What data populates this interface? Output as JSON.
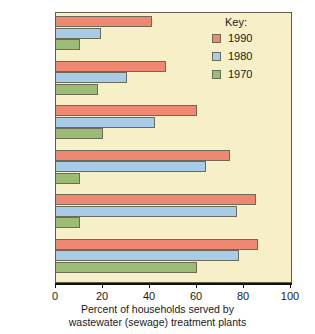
{
  "chart_data": {
    "type": "bar",
    "orientation": "horizontal",
    "title": "",
    "xlabel": "Percent of households served by wastewater (sewage) treatment plants",
    "ylabel": "",
    "xlim": [
      0,
      100
    ],
    "xticks": [
      0,
      20,
      40,
      60,
      80,
      100
    ],
    "grid": false,
    "legend_position": "top-right",
    "legend_title": "Key:",
    "categories": [
      "Spain",
      "Italy",
      "France",
      "U.S.A.",
      "Britain",
      "Germany"
    ],
    "series": [
      {
        "name": "1990",
        "color": "#ee8873",
        "values": [
          41,
          47,
          60,
          74,
          85,
          86
        ]
      },
      {
        "name": "1980",
        "color": "#a8cbe8",
        "values": [
          19,
          30,
          42,
          64,
          77,
          78
        ]
      },
      {
        "name": "1970",
        "color": "#9cbb75",
        "values": [
          10,
          18,
          20,
          10,
          10,
          60
        ]
      }
    ]
  },
  "caption": {
    "line1": "Percent of households served by",
    "line2": "wastewater (sewage) treatment plants"
  },
  "legend": {
    "title": "Key:",
    "items": [
      {
        "label": "1990"
      },
      {
        "label": "1980"
      },
      {
        "label": "1970"
      }
    ]
  },
  "axis": {
    "ticks": [
      {
        "label": "0"
      },
      {
        "label": "20"
      },
      {
        "label": "40"
      },
      {
        "label": "60"
      },
      {
        "label": "80"
      },
      {
        "label": "100"
      }
    ]
  },
  "colors": {
    "plot_background": "#f7efc8",
    "page_background": "#ffffff",
    "bar_1990": "#ee8873",
    "bar_1980": "#a8cbe8",
    "bar_1970": "#9cbb75",
    "bar_outline": "#6b6b57",
    "axis": "#111111"
  }
}
